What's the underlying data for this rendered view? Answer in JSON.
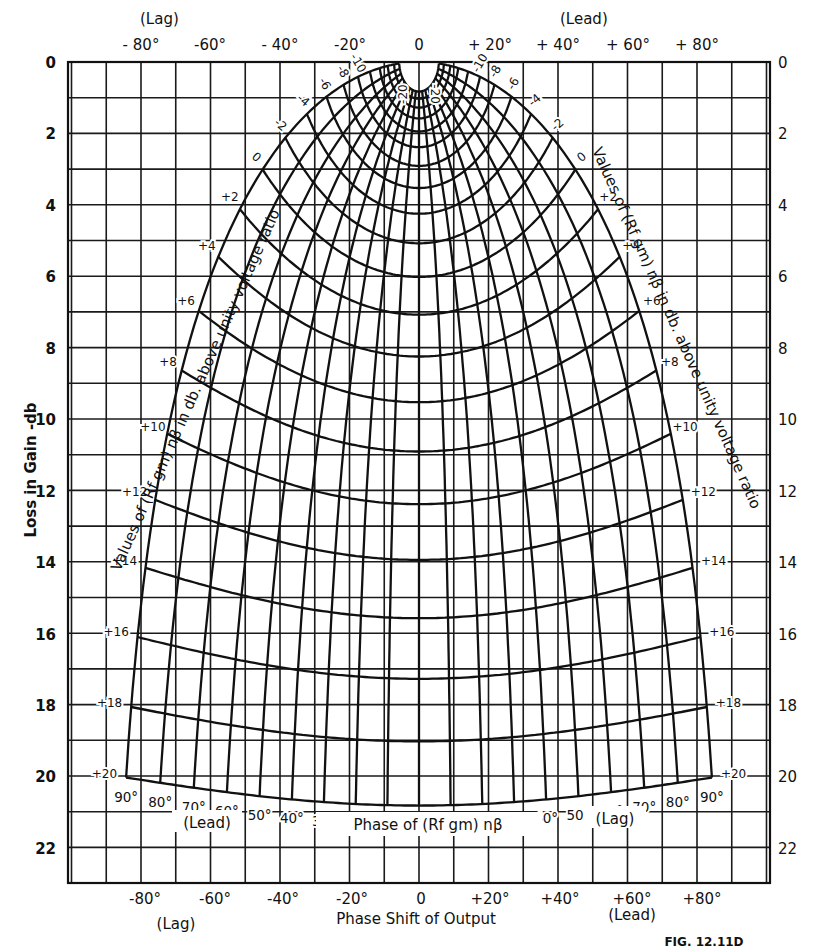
{
  "figure_label": "FIG. 12.11D",
  "top_axis": {
    "lag_label": "(Lag)",
    "lead_label": "(Lead)",
    "ticks": [
      "- 80°",
      "-60°",
      "- 40°",
      "-20°",
      "0",
      "+ 20°",
      "+ 40°",
      "+ 60°",
      "+ 80°"
    ]
  },
  "bottom_axis": {
    "title": "Phase Shift of Output",
    "lag_label": "(Lag)",
    "lead_label": "(Lead)",
    "ticks": [
      "-80°",
      "-60°",
      "-40°",
      "-20°",
      "0",
      "+20°",
      "+40°",
      "+60°",
      "+80°"
    ]
  },
  "left_axis": {
    "title": "Loss in Gain -db",
    "ticks": [
      "0",
      "2",
      "4",
      "6",
      "8",
      "10",
      "12",
      "14",
      "16",
      "18",
      "20",
      "22"
    ]
  },
  "right_axis": {
    "ticks": [
      "0",
      "2",
      "4",
      "6",
      "8",
      "10",
      "12",
      "14",
      "16",
      "18",
      "20",
      "22"
    ]
  },
  "curve_family_titles": {
    "left": "Values of (Rf gm) nβ in db. above unity voltage ratio",
    "right": "Values of (Rf gm) nβ in db. above unity voltage ratio",
    "phase": "Phase of (Rf gm) nβ",
    "phase_left_side": "(Lead)",
    "phase_right_side": "(Lag)"
  },
  "gain_curve_labels": [
    "-20",
    "-10",
    "-8",
    "-6",
    "-4",
    "-2",
    "0",
    "+2",
    "+4",
    "+6",
    "+8",
    "+10",
    "+12",
    "+14",
    "+16",
    "+18",
    "+20"
  ],
  "phase_curve_labels": [
    "90°",
    "80°",
    "70°",
    "60°",
    "50°",
    "40°",
    "30°",
    "20°",
    "10°",
    "0",
    "10°",
    "20°",
    "30°",
    "40°",
    "50°",
    "60°",
    "70°",
    "80°",
    "90°"
  ],
  "chart_data": {
    "type": "line",
    "xlabel": "Phase Shift of Output (degrees)",
    "ylabel": "Loss in Gain - db",
    "xlim": [
      -101,
      101
    ],
    "ylim": [
      23,
      0
    ],
    "x_ticks": [
      -80,
      -60,
      -40,
      -20,
      0,
      20,
      40,
      60,
      80
    ],
    "y_ticks": [
      0,
      2,
      4,
      6,
      8,
      10,
      12,
      14,
      16,
      18,
      20,
      22
    ],
    "grid": {
      "x_step_deg": 10,
      "y_step_db": 1
    },
    "relation": "loss_db = 20*log10|1 + G|, output_phase = ±arg(1 + G), G = 10^(A/20)∠φ",
    "gain_curves_db": [
      -20,
      -18,
      -16,
      -14,
      -12,
      -10,
      -8,
      -6,
      -4,
      -2,
      0,
      2,
      4,
      6,
      8,
      10,
      12,
      14,
      16,
      18,
      20
    ],
    "phase_curves_deg": [
      0,
      10,
      20,
      30,
      40,
      50,
      60,
      70,
      80,
      90
    ],
    "sample_points": [
      {
        "gain_db": 20,
        "phase_deg": 0,
        "loss_db": 20.8,
        "output_phase_deg": 0
      },
      {
        "gain_db": 20,
        "phase_deg": 90,
        "loss_db": 20.0,
        "output_phase_deg": 84.3
      },
      {
        "gain_db": 0,
        "phase_deg": 90,
        "loss_db": 3.0,
        "output_phase_deg": 45
      },
      {
        "gain_db": 0,
        "phase_deg": 0,
        "loss_db": 6.0,
        "output_phase_deg": 0
      },
      {
        "gain_db": -10,
        "phase_deg": 90,
        "loss_db": 0.4,
        "output_phase_deg": 17.5
      },
      {
        "gain_db": -20,
        "phase_deg": 0,
        "loss_db": 0.8,
        "output_phase_deg": 0
      }
    ]
  }
}
